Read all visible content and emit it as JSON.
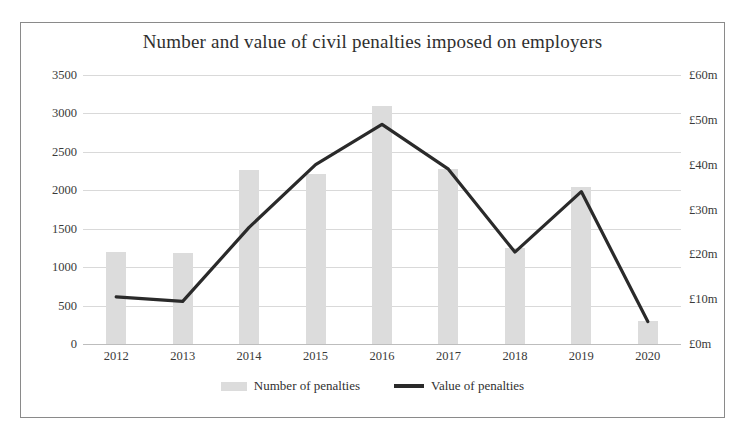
{
  "chart_data": {
    "type": "bar",
    "title": "Number and value of civil penalties imposed on employers",
    "xlabel": "",
    "ylabel": "",
    "categories": [
      "2012",
      "2013",
      "2014",
      "2015",
      "2016",
      "2017",
      "2018",
      "2019",
      "2020"
    ],
    "grid": true,
    "legend_position": "bottom",
    "axes": {
      "left": {
        "ticks": [
          "0",
          "500",
          "1000",
          "1500",
          "2000",
          "2500",
          "3000",
          "3500"
        ],
        "tick_values": [
          0,
          500,
          1000,
          1500,
          2000,
          2500,
          3000,
          3500
        ],
        "min": 0,
        "max": 3500
      },
      "right": {
        "ticks": [
          "£0m",
          "£10m",
          "£20m",
          "£30m",
          "£40m",
          "£50m",
          "£60m"
        ],
        "tick_values": [
          0,
          10,
          20,
          30,
          40,
          50,
          60
        ],
        "min": 0,
        "max": 60,
        "unit": "£m"
      }
    },
    "series": [
      {
        "name": "Number of penalties",
        "type": "bar",
        "axis": "left",
        "color": "#dcdcdc",
        "values": [
          1200,
          1190,
          2270,
          2210,
          3100,
          2280,
          1250,
          2040,
          300
        ]
      },
      {
        "name": "Value of penalties",
        "type": "line",
        "axis": "right",
        "color": "#2a2a2a",
        "values": [
          10.5,
          9.5,
          26,
          40,
          49,
          39,
          20.5,
          34,
          5
        ]
      }
    ]
  },
  "legend": {
    "items": [
      {
        "label": "Number of penalties",
        "marker": "bar-swatch"
      },
      {
        "label": "Value of penalties",
        "marker": "line-swatch"
      }
    ]
  }
}
